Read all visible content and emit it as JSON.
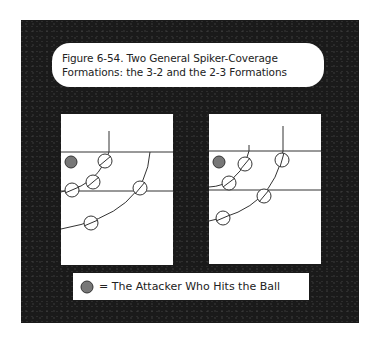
{
  "figure": {
    "title_line1": "Figure 6-54. Two General Spiker-Coverage",
    "title_line2": "Formations: the 3-2 and the 2-3 Formations"
  },
  "legend": {
    "icon": "shaded-circle-attacker",
    "text": "= The Attacker Who Hits the Ball"
  },
  "colors": {
    "frame": "#1a1a1a",
    "panel": "#ffffff",
    "line": "#333333",
    "attacker_fill": "#777777"
  },
  "diagrams": [
    {
      "name": "3-2 formation",
      "attacker": {
        "x": 10,
        "y": 48
      },
      "lines_y": [
        38,
        77
      ],
      "players": [
        [
          44,
          47
        ],
        [
          32,
          68
        ],
        [
          11,
          76
        ],
        [
          79,
          74
        ],
        [
          30,
          109
        ]
      ]
    },
    {
      "name": "2-3 formation",
      "attacker": {
        "x": 10,
        "y": 48
      },
      "lines_y": [
        37,
        76
      ],
      "players": [
        [
          36,
          50
        ],
        [
          20,
          69
        ],
        [
          73,
          46
        ],
        [
          55,
          82
        ],
        [
          14,
          104
        ]
      ]
    }
  ]
}
